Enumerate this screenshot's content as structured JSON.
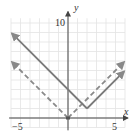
{
  "chart_data": {
    "type": "line",
    "title": "",
    "xlabel": "x",
    "ylabel": "y",
    "xlim": [
      -6,
      6
    ],
    "ylim": [
      -1.5,
      11
    ],
    "grid": true,
    "x_tick_labels": [
      "-5",
      "5"
    ],
    "y_tick_labels": [
      "10"
    ],
    "series": [
      {
        "name": "y = |x|",
        "style": "dashed",
        "color": "#8a8a8a",
        "x": [
          -5.9,
          0,
          5.9
        ],
        "y": [
          5.9,
          0,
          5.9
        ]
      },
      {
        "name": "y = |x - 2| + 1",
        "style": "solid",
        "color": "#7a7a7a",
        "x": [
          -5.9,
          2,
          5.9
        ],
        "y": [
          8.9,
          1,
          4.9
        ]
      }
    ],
    "points": [
      {
        "x": 0,
        "y": 0,
        "label": "origin vertex"
      }
    ]
  },
  "labels": {
    "x_axis": "x",
    "y_axis": "y",
    "x_neg": "−5",
    "x_pos": "5",
    "y_top": "10"
  }
}
